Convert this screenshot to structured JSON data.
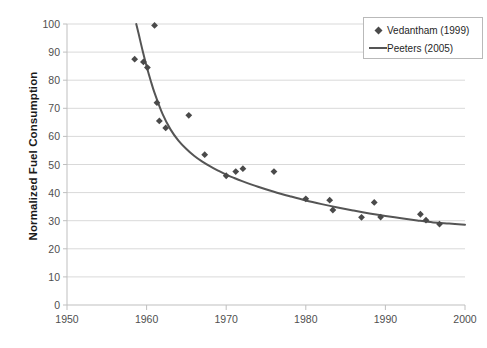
{
  "chart_data": {
    "type": "scatter",
    "title": "",
    "xlabel": "",
    "ylabel": "Normalized Fuel Consumption",
    "xlim": [
      1950,
      2000
    ],
    "ylim": [
      0,
      100
    ],
    "xticks": [
      1950,
      1960,
      1970,
      1980,
      1990,
      2000
    ],
    "yticks": [
      0,
      10,
      20,
      30,
      40,
      50,
      60,
      70,
      80,
      90,
      100
    ],
    "grid": "horizontal",
    "legend_position": "top-right",
    "colors": {
      "marker": "#4a4a4a",
      "line": "#555555",
      "grid": "#d9d9d9",
      "axis": "#bfbfbf",
      "tick_label": "#4f4f4f",
      "axis_title": "#1a1a1a"
    },
    "series": [
      {
        "name": "Vedantham (1999)",
        "type": "scatter",
        "marker": "diamond",
        "x": [
          1958.5,
          1959.6,
          1960.1,
          1961.0,
          1961.3,
          1961.6,
          1962.4,
          1965.3,
          1967.3,
          1970.0,
          1971.2,
          1972.1,
          1976.0,
          1980.0,
          1983.0,
          1983.4,
          1987.0,
          1988.6,
          1989.4,
          1994.4,
          1995.1,
          1996.8
        ],
        "y": [
          87.5,
          86.5,
          84.5,
          99.5,
          72.0,
          65.5,
          63.0,
          67.5,
          53.5,
          46.0,
          47.5,
          48.5,
          47.5,
          37.8,
          37.3,
          33.8,
          31.2,
          36.5,
          31.3,
          32.3,
          30.2,
          28.8
        ]
      },
      {
        "name": "Peeters (2005)",
        "type": "line",
        "x": [
          1958.7,
          1959.0,
          1959.5,
          1960.0,
          1960.5,
          1961.0,
          1962.0,
          1963.0,
          1964.0,
          1965.0,
          1966.0,
          1967.0,
          1968.0,
          1969.0,
          1970.0,
          1971.0,
          1972.0,
          1974.0,
          1976.0,
          1978.0,
          1980.0,
          1982.0,
          1984.0,
          1986.0,
          1988.0,
          1990.0,
          1992.0,
          1994.0,
          1996.0,
          1998.0,
          2000.0
        ],
        "y": [
          100.0,
          96.5,
          90.5,
          85.0,
          80.0,
          75.5,
          68.0,
          62.5,
          58.5,
          55.5,
          53.0,
          51.0,
          49.3,
          47.8,
          46.4,
          45.2,
          44.1,
          42.1,
          40.3,
          38.7,
          37.2,
          35.9,
          34.7,
          33.6,
          32.6,
          31.7,
          30.9,
          30.1,
          29.4,
          29.0,
          28.6
        ]
      }
    ]
  },
  "legend": {
    "items": [
      {
        "label": "Vedantham (1999)",
        "marker": "diamond"
      },
      {
        "label": "Peeters (2005)",
        "marker": "line"
      }
    ]
  }
}
